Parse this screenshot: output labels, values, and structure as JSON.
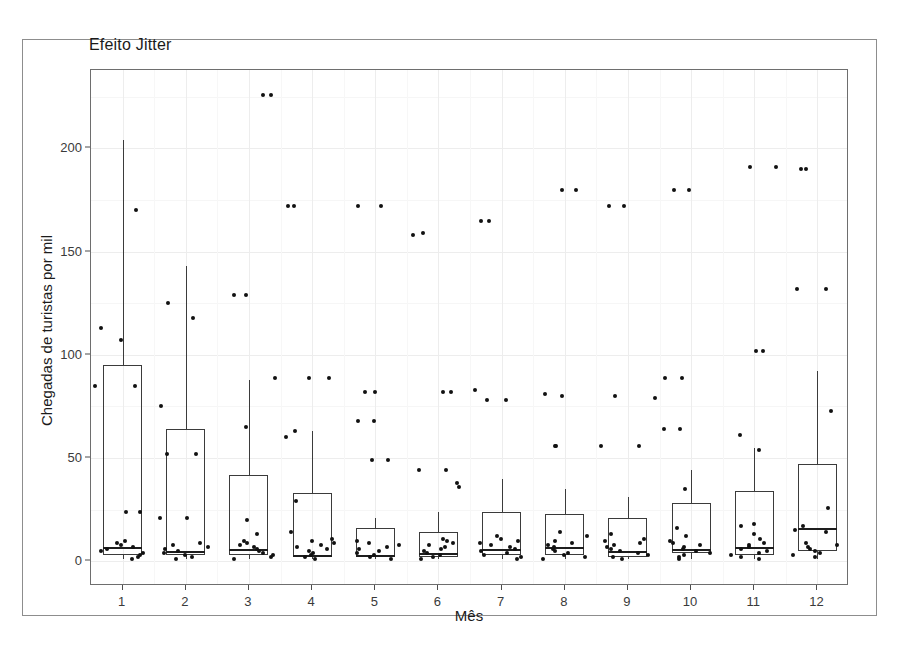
{
  "figure": {
    "title": "Efeito Jitter",
    "background": "#ffffff",
    "panel_border": "#6e6e6e",
    "point_color": "#111111",
    "box_color": "#3b3b3b"
  },
  "chart_data": {
    "type": "box",
    "title": "Efeito Jitter",
    "xlabel": "Mês",
    "ylabel": "Chegadas de turistas por mil",
    "categories": [
      "1",
      "2",
      "3",
      "4",
      "5",
      "6",
      "7",
      "8",
      "9",
      "10",
      "11",
      "12"
    ],
    "x_tick_labels": [
      "1",
      "2",
      "3",
      "4",
      "5",
      "6",
      "7",
      "8",
      "9",
      "10",
      "11",
      "12"
    ],
    "y_tick_labels": [
      "0",
      "50",
      "100",
      "150",
      "200"
    ],
    "y_ticks": [
      0,
      50,
      100,
      150,
      200
    ],
    "ylim": [
      -12,
      238
    ],
    "grid": true,
    "legend": "none",
    "boxes": [
      {
        "category": "1",
        "q1": 3,
        "median": 7,
        "q3": 95,
        "whisker_low": 1,
        "whisker_high": 204,
        "outliers": [
          170,
          107,
          113,
          85,
          24
        ],
        "jitter_points": [
          1,
          2,
          3,
          4,
          5,
          6,
          7,
          8,
          9,
          10,
          24,
          85
        ]
      },
      {
        "category": "2",
        "q1": 3,
        "median": 5,
        "q3": 64,
        "whisker_low": 1,
        "whisker_high": 143,
        "outliers": [
          125,
          118,
          75,
          52,
          21
        ],
        "jitter_points": [
          1,
          2,
          3,
          4,
          5,
          6,
          7,
          8,
          9,
          21,
          52
        ]
      },
      {
        "category": "3",
        "q1": 3,
        "median": 6,
        "q3": 42,
        "whisker_low": 1,
        "whisker_high": 88,
        "outliers": [
          226,
          226,
          129,
          129,
          89,
          65
        ],
        "jitter_points": [
          1,
          2,
          3,
          4,
          5,
          6,
          7,
          8,
          9,
          10,
          13,
          20
        ]
      },
      {
        "category": "4",
        "q1": 2,
        "median": 3,
        "q3": 33,
        "whisker_low": 1,
        "whisker_high": 63,
        "outliers": [
          172,
          172,
          89,
          89,
          63,
          60,
          29
        ],
        "jitter_points": [
          1,
          2,
          3,
          4,
          5,
          6,
          7,
          8,
          9,
          10,
          11,
          14
        ]
      },
      {
        "category": "5",
        "q1": 2,
        "median": 3,
        "q3": 16,
        "whisker_low": 1,
        "whisker_high": 21,
        "outliers": [
          172,
          172,
          82,
          82,
          68,
          68,
          49,
          49
        ],
        "jitter_points": [
          1,
          2,
          3,
          4,
          5,
          6,
          7,
          8,
          9,
          10
        ]
      },
      {
        "category": "6",
        "q1": 2,
        "median": 4,
        "q3": 14,
        "whisker_low": 1,
        "whisker_high": 24,
        "outliers": [
          159,
          158,
          82,
          82,
          44,
          44,
          38,
          36
        ],
        "jitter_points": [
          1,
          2,
          3,
          4,
          5,
          6,
          7,
          8,
          9,
          10,
          11
        ]
      },
      {
        "category": "7",
        "q1": 3,
        "median": 6,
        "q3": 24,
        "whisker_low": 1,
        "whisker_high": 40,
        "outliers": [
          165,
          165,
          83,
          78,
          78
        ],
        "jitter_points": [
          1,
          2,
          3,
          4,
          5,
          6,
          7,
          8,
          9,
          10,
          11,
          12
        ]
      },
      {
        "category": "8",
        "q1": 3,
        "median": 7,
        "q3": 23,
        "whisker_low": 1,
        "whisker_high": 35,
        "outliers": [
          180,
          180,
          81,
          80,
          56,
          56
        ],
        "jitter_points": [
          1,
          2,
          3,
          4,
          5,
          6,
          7,
          8,
          9,
          10,
          12,
          14
        ]
      },
      {
        "category": "9",
        "q1": 2,
        "median": 5,
        "q3": 21,
        "whisker_low": 1,
        "whisker_high": 31,
        "outliers": [
          172,
          172,
          80,
          79,
          56,
          56
        ],
        "jitter_points": [
          1,
          2,
          3,
          4,
          5,
          6,
          7,
          8,
          9,
          10,
          11,
          13
        ]
      },
      {
        "category": "10",
        "q1": 4,
        "median": 6,
        "q3": 28,
        "whisker_low": 1,
        "whisker_high": 44,
        "outliers": [
          180,
          180,
          89,
          89,
          64,
          64,
          35
        ],
        "jitter_points": [
          1,
          2,
          3,
          4,
          5,
          6,
          7,
          8,
          9,
          10,
          12,
          16
        ]
      },
      {
        "category": "11",
        "q1": 3,
        "median": 7,
        "q3": 34,
        "whisker_low": 1,
        "whisker_high": 55,
        "outliers": [
          191,
          191,
          102,
          102,
          61,
          54
        ],
        "jitter_points": [
          1,
          2,
          3,
          4,
          5,
          6,
          7,
          8,
          9,
          11,
          13,
          17,
          18
        ]
      },
      {
        "category": "12",
        "q1": 5,
        "median": 16,
        "q3": 47,
        "whisker_low": 1,
        "whisker_high": 92,
        "outliers": [
          190,
          190,
          132,
          132,
          73
        ],
        "jitter_points": [
          2,
          3,
          4,
          5,
          6,
          7,
          8,
          9,
          14,
          15,
          17,
          26
        ]
      }
    ]
  }
}
